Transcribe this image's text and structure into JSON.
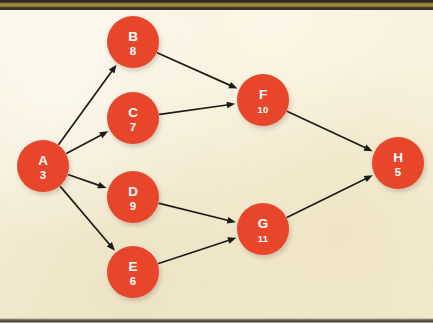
{
  "figure": {
    "type": "directed-acyclic-graph",
    "title": "",
    "background_color": "#f7f0da",
    "node_color": "#e8462b",
    "node_text_color": "#ffffff",
    "edge_color": "#1d1b17",
    "top_band_color": "#2b2a24",
    "top_band_accent_color": "#a98f3f",
    "bottom_rule_color": "#4a463d"
  },
  "graph_data": {
    "type": "diagram",
    "directed": true,
    "node_radius": 26,
    "nodes": [
      {
        "id": "A",
        "label": "A",
        "value": "3",
        "cx": 43,
        "cy": 166,
        "r": 26
      },
      {
        "id": "B",
        "label": "B",
        "value": "8",
        "cx": 133,
        "cy": 42,
        "r": 26
      },
      {
        "id": "C",
        "label": "C",
        "value": "7",
        "cx": 133,
        "cy": 118,
        "r": 26
      },
      {
        "id": "D",
        "label": "D",
        "value": "9",
        "cx": 133,
        "cy": 197,
        "r": 26
      },
      {
        "id": "E",
        "label": "E",
        "value": "6",
        "cx": 133,
        "cy": 272,
        "r": 26
      },
      {
        "id": "F",
        "label": "F",
        "value": "10",
        "cx": 263,
        "cy": 100,
        "r": 26
      },
      {
        "id": "G",
        "label": "G",
        "value": "11",
        "cx": 263,
        "cy": 229,
        "r": 26
      },
      {
        "id": "H",
        "label": "H",
        "value": "5",
        "cx": 398,
        "cy": 163,
        "r": 26
      }
    ],
    "edges": [
      {
        "from": "A",
        "to": "B"
      },
      {
        "from": "A",
        "to": "C"
      },
      {
        "from": "A",
        "to": "D"
      },
      {
        "from": "A",
        "to": "E"
      },
      {
        "from": "B",
        "to": "F"
      },
      {
        "from": "C",
        "to": "F"
      },
      {
        "from": "D",
        "to": "G"
      },
      {
        "from": "E",
        "to": "G"
      },
      {
        "from": "F",
        "to": "H"
      },
      {
        "from": "G",
        "to": "H"
      }
    ]
  }
}
